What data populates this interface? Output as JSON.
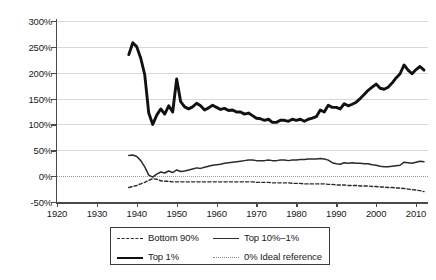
{
  "chart_data": {
    "type": "line",
    "title": "",
    "xlabel": "",
    "ylabel": "",
    "xlim": [
      1920,
      2013
    ],
    "ylim": [
      -50,
      300
    ],
    "grid": true,
    "legend_position": "bottom",
    "y_ticks": [
      "300%",
      "250%",
      "200%",
      "150%",
      "100%",
      "50%",
      "0%",
      "-50%"
    ],
    "y_tick_values": [
      300,
      250,
      200,
      150,
      100,
      50,
      0,
      -50
    ],
    "x_ticks": [
      "1920",
      "1930",
      "1940",
      "1950",
      "1960",
      "1970",
      "1980",
      "1990",
      "2000",
      "2010"
    ],
    "x_tick_values": [
      1920,
      1930,
      1940,
      1950,
      1960,
      1970,
      1980,
      1990,
      2000,
      2010
    ],
    "reference_line": {
      "label": "0% Ideal reference",
      "value": 0,
      "style": "dotted"
    },
    "series": [
      {
        "name": "Top 1%",
        "style": "solid-thick",
        "color": "#111111",
        "x": [
          1938,
          1939,
          1940,
          1941,
          1942,
          1943,
          1944,
          1945,
          1946,
          1947,
          1948,
          1949,
          1950,
          1951,
          1952,
          1953,
          1954,
          1955,
          1956,
          1957,
          1958,
          1959,
          1960,
          1961,
          1962,
          1963,
          1964,
          1965,
          1966,
          1967,
          1968,
          1969,
          1970,
          1971,
          1972,
          1973,
          1974,
          1975,
          1976,
          1977,
          1978,
          1979,
          1980,
          1981,
          1982,
          1983,
          1984,
          1985,
          1986,
          1987,
          1988,
          1989,
          1990,
          1991,
          1992,
          1993,
          1994,
          1995,
          1996,
          1997,
          1998,
          1999,
          2000,
          2001,
          2002,
          2003,
          2004,
          2005,
          2006,
          2007,
          2008,
          2009,
          2010,
          2011,
          2012
        ],
        "values": [
          235,
          258,
          250,
          228,
          196,
          122,
          100,
          118,
          130,
          120,
          136,
          124,
          188,
          144,
          134,
          130,
          134,
          141,
          136,
          128,
          132,
          137,
          133,
          129,
          131,
          127,
          128,
          124,
          124,
          120,
          122,
          117,
          112,
          111,
          108,
          110,
          104,
          104,
          108,
          108,
          106,
          110,
          108,
          110,
          106,
          110,
          112,
          115,
          128,
          124,
          137,
          133,
          133,
          130,
          140,
          136,
          139,
          143,
          150,
          158,
          166,
          172,
          178,
          170,
          168,
          172,
          180,
          190,
          198,
          215,
          205,
          198,
          206,
          212,
          205
        ]
      },
      {
        "name": "Top 10%–1%",
        "style": "solid-thin",
        "color": "#2b2b2b",
        "x": [
          1938,
          1939,
          1940,
          1941,
          1942,
          1943,
          1944,
          1945,
          1946,
          1947,
          1948,
          1949,
          1950,
          1951,
          1952,
          1953,
          1954,
          1955,
          1956,
          1957,
          1958,
          1959,
          1960,
          1961,
          1962,
          1963,
          1964,
          1965,
          1966,
          1967,
          1968,
          1969,
          1970,
          1971,
          1972,
          1973,
          1974,
          1975,
          1976,
          1977,
          1978,
          1979,
          1980,
          1981,
          1982,
          1983,
          1984,
          1985,
          1986,
          1987,
          1988,
          1989,
          1990,
          1991,
          1992,
          1993,
          1994,
          1995,
          1996,
          1997,
          1998,
          1999,
          2000,
          2001,
          2002,
          2003,
          2004,
          2005,
          2006,
          2007,
          2008,
          2009,
          2010,
          2011,
          2012
        ],
        "values": [
          40,
          41,
          38,
          30,
          18,
          2,
          -2,
          4,
          8,
          6,
          10,
          7,
          12,
          9,
          10,
          12,
          14,
          16,
          15,
          17,
          19,
          21,
          22,
          23,
          25,
          26,
          27,
          28,
          29,
          30,
          31,
          31,
          30,
          30,
          30,
          31,
          30,
          30,
          31,
          31,
          30,
          31,
          31,
          32,
          32,
          33,
          33,
          33,
          34,
          33,
          31,
          26,
          24,
          23,
          26,
          25,
          26,
          25,
          25,
          24,
          24,
          22,
          21,
          19,
          18,
          18,
          19,
          20,
          21,
          27,
          26,
          25,
          27,
          29,
          28
        ]
      },
      {
        "name": "Bottom 90%",
        "style": "dashed",
        "color": "#2b2b2b",
        "x": [
          1938,
          1939,
          1940,
          1941,
          1942,
          1943,
          1944,
          1945,
          1946,
          1947,
          1948,
          1949,
          1950,
          1951,
          1952,
          1953,
          1954,
          1955,
          1956,
          1957,
          1958,
          1959,
          1960,
          1961,
          1962,
          1963,
          1964,
          1965,
          1966,
          1967,
          1968,
          1969,
          1970,
          1971,
          1972,
          1973,
          1974,
          1975,
          1976,
          1977,
          1978,
          1979,
          1980,
          1981,
          1982,
          1983,
          1984,
          1985,
          1986,
          1987,
          1988,
          1989,
          1990,
          1991,
          1992,
          1993,
          1994,
          1995,
          1996,
          1997,
          1998,
          1999,
          2000,
          2001,
          2002,
          2003,
          2004,
          2005,
          2006,
          2007,
          2008,
          2009,
          2010,
          2011,
          2012
        ],
        "values": [
          -22,
          -20,
          -18,
          -15,
          -12,
          -8,
          -5,
          -6,
          -9,
          -10,
          -10,
          -11,
          -11,
          -11,
          -11,
          -11,
          -11,
          -11,
          -11,
          -11,
          -11,
          -11,
          -11,
          -11,
          -11,
          -11,
          -11,
          -11,
          -11,
          -11,
          -11,
          -11,
          -12,
          -12,
          -12,
          -12,
          -13,
          -13,
          -13,
          -13,
          -13,
          -14,
          -14,
          -14,
          -15,
          -15,
          -15,
          -15,
          -15,
          -15,
          -16,
          -16,
          -17,
          -17,
          -17,
          -18,
          -18,
          -18,
          -19,
          -19,
          -19,
          -20,
          -20,
          -21,
          -21,
          -22,
          -22,
          -23,
          -23,
          -24,
          -25,
          -26,
          -27,
          -28,
          -30
        ]
      }
    ],
    "legend": [
      {
        "label": "Bottom 90%",
        "style": "dashed"
      },
      {
        "label": "Top 10%–1%",
        "style": "solid-thin"
      },
      {
        "label": "Top 1%",
        "style": "solid-thick"
      },
      {
        "label": "0% Ideal reference",
        "style": "dotted"
      }
    ]
  }
}
